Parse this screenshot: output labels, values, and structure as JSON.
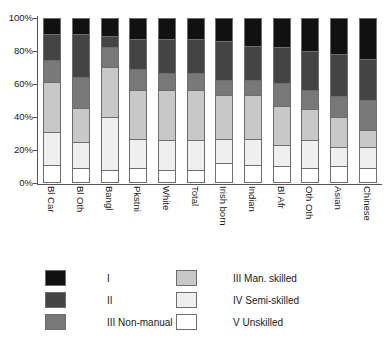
{
  "chart_data": {
    "type": "bar",
    "subtype": "stacked-percentage",
    "title": "",
    "xlabel": "",
    "ylabel": "",
    "ylim": [
      0,
      100
    ],
    "ytick_labels": [
      "0%",
      "20%",
      "40%",
      "60%",
      "80%",
      "100%"
    ],
    "ytick_values": [
      0,
      20,
      40,
      60,
      80,
      100
    ],
    "grid": false,
    "legend_position": "below",
    "stack_order_top_to_bottom": [
      "I",
      "II",
      "III Non-manual",
      "III Man. skilled",
      "IV Semi-skilled",
      "V Unskilled"
    ],
    "categories": [
      "Bl Car",
      "Bl Oth",
      "Bangl",
      "Pkstni",
      "White",
      "Total",
      "Irish born",
      "Indian",
      "Bl Afr",
      "Oth Oth",
      "Asian",
      "Chinese"
    ],
    "series": [
      {
        "name": "I",
        "color": "#111111",
        "values": [
          10,
          10,
          11,
          13,
          13,
          13,
          14,
          17,
          18,
          20,
          22,
          25
        ]
      },
      {
        "name": "II",
        "color": "#444444",
        "values": [
          16,
          26,
          7,
          18,
          21,
          21,
          24,
          21,
          22,
          24,
          26,
          25
        ]
      },
      {
        "name": "III Non-manual",
        "color": "#787878",
        "values": [
          13,
          19,
          12,
          13,
          10,
          10,
          9,
          9,
          14,
          12,
          13,
          19
        ]
      },
      {
        "name": "III Man. skilled",
        "color": "#c8c8c8",
        "values": [
          31,
          21,
          31,
          30,
          31,
          31,
          27,
          27,
          24,
          19,
          18,
          10
        ]
      },
      {
        "name": "IV Semi-skilled",
        "color": "#efefef",
        "values": [
          20,
          16,
          32,
          18,
          18,
          18,
          15,
          16,
          13,
          17,
          12,
          13
        ]
      },
      {
        "name": "V Unskilled",
        "color": "#ffffff",
        "values": [
          10,
          8,
          7,
          8,
          7,
          7,
          11,
          10,
          9,
          8,
          9,
          8
        ]
      }
    ]
  },
  "legend": {
    "items": [
      {
        "label": "I",
        "color": "#111111",
        "column": "left"
      },
      {
        "label": "II",
        "color": "#444444",
        "column": "left"
      },
      {
        "label": "III Non-manual",
        "color": "#787878",
        "column": "left"
      },
      {
        "label": "III Man. skilled",
        "color": "#c8c8c8",
        "column": "right"
      },
      {
        "label": "IV Semi-skilled",
        "color": "#efefef",
        "column": "right"
      },
      {
        "label": "V Unskilled",
        "color": "#ffffff",
        "column": "right"
      }
    ]
  }
}
